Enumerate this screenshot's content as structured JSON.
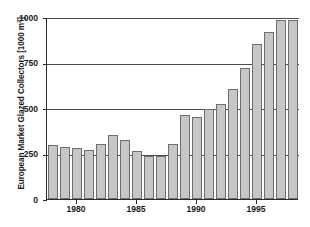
{
  "chart_data": {
    "type": "bar",
    "title": "",
    "xlabel": "",
    "ylabel": "European Market Glazed Collectors [1000 m²]",
    "ylabel_main": "European Market Glazed Collectors [1000 m",
    "ylabel_sup": "2",
    "ylabel_tail": "]",
    "ylim": [
      0,
      1000
    ],
    "xlim": [
      1977.5,
      1998.5
    ],
    "grid": true,
    "legend": null,
    "ytick_labels": [
      "0",
      "250",
      "500",
      "750",
      "1000"
    ],
    "ytick_values": [
      0,
      250,
      500,
      750,
      1000
    ],
    "xtick_labels": [
      "1980",
      "1985",
      "1990",
      "1995"
    ],
    "xtick_values": [
      1980,
      1985,
      1990,
      1995
    ],
    "categories": [
      "1978",
      "1979",
      "1980",
      "1981",
      "1982",
      "1983",
      "1984",
      "1985",
      "1986",
      "1987",
      "1988",
      "1989",
      "1990",
      "1991",
      "1992",
      "1993",
      "1994",
      "1995",
      "1996",
      "1997",
      "1998"
    ],
    "values": [
      295,
      288,
      280,
      272,
      302,
      350,
      322,
      263,
      235,
      235,
      302,
      462,
      452,
      492,
      520,
      602,
      718,
      850,
      915,
      985,
      985
    ],
    "bar_color": "#c6c6c6",
    "bar_edge_color": "#6e6e6e",
    "axis_color": "#2b2b2b",
    "grid_color": "#4d4d4d",
    "background": "#ffffff"
  }
}
